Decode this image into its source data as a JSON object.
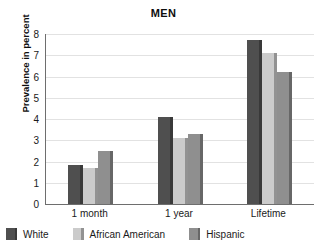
{
  "chart_data": {
    "type": "bar",
    "title": "MEN",
    "xlabel": "",
    "ylabel": "Prevalence in percent",
    "ylim": [
      0,
      8
    ],
    "yticks": [
      0,
      1,
      2,
      3,
      4,
      5,
      6,
      7,
      8
    ],
    "ytick_labels": [
      "0",
      "1",
      "2",
      "3",
      "4",
      "5",
      "6",
      "7",
      "8"
    ],
    "grid": true,
    "legend_position": "bottom-left",
    "categories": [
      "1 month",
      "1 year",
      "Lifetime"
    ],
    "series": [
      {
        "name": "White",
        "color": "#4f4f4f",
        "values": [
          1.85,
          4.1,
          7.7
        ]
      },
      {
        "name": "African American",
        "color": "#cbcbcb",
        "values": [
          1.7,
          3.1,
          7.1
        ]
      },
      {
        "name": "Hispanic",
        "color": "#8f8f8f",
        "values": [
          2.5,
          3.3,
          6.2
        ]
      }
    ]
  }
}
